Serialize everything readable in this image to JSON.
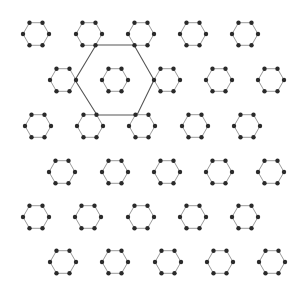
{
  "diagram": {
    "colors": {
      "background": "#ffffff",
      "ring_edge": "#9a9a9a",
      "vertex_dot": "#2a2a2a",
      "large_hexagon": "#555555"
    },
    "ring_radius": 13,
    "dot_radius": 2.2,
    "rows": [
      {
        "y": 34,
        "xs": [
          36,
          89,
          141,
          193,
          245
        ]
      },
      {
        "y": 80,
        "xs": [
          63,
          115,
          167,
          219,
          271
        ]
      },
      {
        "y": 126,
        "xs": [
          38,
          90,
          142,
          195,
          247
        ]
      },
      {
        "y": 172,
        "xs": [
          62,
          115,
          167,
          219,
          271
        ]
      },
      {
        "y": 217,
        "xs": [
          36,
          88,
          141,
          193,
          245
        ]
      },
      {
        "y": 262,
        "xs": [
          63,
          115,
          168,
          220,
          272
        ]
      }
    ],
    "large_hexagon": {
      "vertices": [
        [
          96,
          45
        ],
        [
          134,
          45
        ],
        [
          154,
          80
        ],
        [
          137,
          115
        ],
        [
          97,
          115
        ],
        [
          75,
          80
        ]
      ]
    }
  }
}
